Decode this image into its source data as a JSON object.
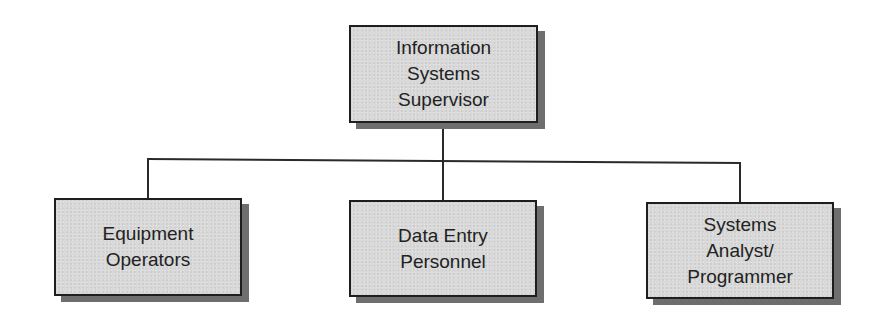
{
  "diagram": {
    "type": "org-chart",
    "root": {
      "label": "Information\nSystems\nSupervisor"
    },
    "children": [
      {
        "label": "Equipment\nOperators"
      },
      {
        "label": "Data Entry\nPersonnel"
      },
      {
        "label": "Systems\nAnalyst/\nProgrammer"
      }
    ],
    "colors": {
      "box_fill": "#d9d9d9",
      "box_border": "#1e1e1e",
      "shadow": "#6e6e6e",
      "line": "#2a2a2a",
      "text": "#222222"
    }
  }
}
